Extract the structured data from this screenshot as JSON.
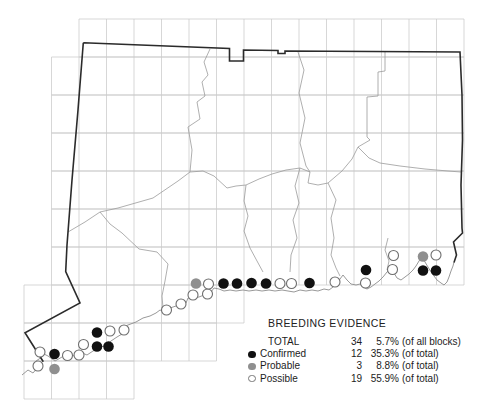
{
  "legend": {
    "title": "BREEDING EVIDENCE",
    "rows": [
      {
        "marker": "none",
        "label": "TOTAL",
        "count": "34",
        "pct": "5.7%",
        "note": "(of all blocks)"
      },
      {
        "marker": "confirmed",
        "label": "Confirmed",
        "count": "12",
        "pct": "35.3%",
        "note": "(of total)"
      },
      {
        "marker": "probable",
        "label": "Probable",
        "count": "3",
        "pct": "8.8%",
        "note": "(of total)"
      },
      {
        "marker": "possible",
        "label": "Possible",
        "count": "19",
        "pct": "55.9%",
        "note": "(of total)"
      }
    ]
  },
  "colors": {
    "confirmed": "#111111",
    "probable": "#8f8f8f",
    "possible_fill": "#ffffff",
    "possible_stroke": "#6e6e6e",
    "grid": "#c9c9c9",
    "county": "#9a9a9a",
    "coast": "#8d8d8d",
    "border": "#2b2b2b",
    "background": "#ffffff"
  },
  "map": {
    "dot_radius": 5.3,
    "grid": {
      "col_start": 24,
      "col_step": 27.5,
      "row_step": 38,
      "rows": [
        {
          "y0": 19,
          "x0": 79,
          "x1": 464
        },
        {
          "y0": 57,
          "x0": 51.5,
          "x1": 464
        },
        {
          "y0": 95,
          "x0": 51.5,
          "x1": 464
        },
        {
          "y0": 133,
          "x0": 51.5,
          "x1": 464
        },
        {
          "y0": 171,
          "x0": 51.5,
          "x1": 464
        },
        {
          "y0": 209,
          "x0": 51.5,
          "x1": 464
        },
        {
          "y0": 247,
          "x0": 51.5,
          "x1": 464
        },
        {
          "y0": 285,
          "x0": 24,
          "x1": 244
        },
        {
          "y0": 323,
          "x0": 24,
          "x1": 216.5
        },
        {
          "y0": 361,
          "x0": 24,
          "x1": 134
        }
      ]
    },
    "dots": {
      "confirmed": [
        [
          97,
          332.5
        ],
        [
          97,
          346.5
        ],
        [
          108.5,
          346.5
        ],
        [
          54.5,
          354
        ],
        [
          223.5,
          283.5
        ],
        [
          237,
          283.5
        ],
        [
          251.5,
          283
        ],
        [
          266,
          283.5
        ],
        [
          309.5,
          283
        ],
        [
          366,
          270
        ],
        [
          423,
          270.5
        ],
        [
          436,
          270.5
        ]
      ],
      "probable": [
        [
          54.5,
          369
        ],
        [
          196,
          283.5
        ],
        [
          423,
          256.5
        ]
      ],
      "possible": [
        [
          40,
          352
        ],
        [
          38,
          366
        ],
        [
          67.5,
          355.5
        ],
        [
          79,
          355
        ],
        [
          83.5,
          344.5
        ],
        [
          110,
          331
        ],
        [
          124,
          330
        ],
        [
          166.5,
          310
        ],
        [
          181,
          304
        ],
        [
          193,
          295
        ],
        [
          207.5,
          294
        ],
        [
          208.5,
          284
        ],
        [
          280,
          283.5
        ],
        [
          291.5,
          283.5
        ],
        [
          335,
          282
        ],
        [
          365.5,
          283
        ],
        [
          392.5,
          269.5
        ],
        [
          393.5,
          255.5
        ],
        [
          436,
          255
        ]
      ]
    }
  }
}
